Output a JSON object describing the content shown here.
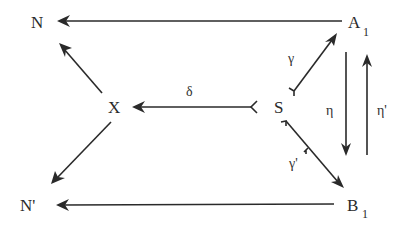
{
  "diagram": {
    "type": "commutative-diagram",
    "nodes": {
      "N": {
        "label": "N",
        "x": 38,
        "y": 28
      },
      "A1": {
        "label": "A",
        "subscript": "1",
        "x": 350,
        "y": 28
      },
      "X": {
        "label": "X",
        "x": 114,
        "y": 113
      },
      "S": {
        "label": "S",
        "x": 273,
        "y": 113
      },
      "N_prime": {
        "label": "N'",
        "x": 32,
        "y": 211
      },
      "B1": {
        "label": "B",
        "subscript": "1",
        "x": 347,
        "y": 211
      }
    },
    "edges": [
      {
        "id": "A1-to-N",
        "from": "A1",
        "to": "N",
        "label": ""
      },
      {
        "id": "X-to-N",
        "from": "X",
        "to": "N",
        "label": ""
      },
      {
        "id": "S-to-X",
        "from": "S",
        "to": "X",
        "label": "δ",
        "tail": "monic-hook"
      },
      {
        "id": "X-to-N_prime",
        "from": "X",
        "to": "N_prime",
        "label": ""
      },
      {
        "id": "S-to-A1",
        "from": "S",
        "to": "A1",
        "label": "γ",
        "tail": "monic-hook"
      },
      {
        "id": "S-to-B1",
        "from": "S",
        "to": "B1",
        "label": "γ'",
        "tail": "monic-hook"
      },
      {
        "id": "A1-to-B1",
        "from": "A1",
        "to": "B1",
        "label": "η"
      },
      {
        "id": "B1-to-A1",
        "from": "B1",
        "to": "A1",
        "label": "η'"
      },
      {
        "id": "B1-to-N_prime",
        "from": "B1",
        "to": "N_prime",
        "label": ""
      }
    ],
    "labels": {
      "delta": "δ",
      "gamma": "γ",
      "gamma_prime": "γ'",
      "eta": "η",
      "eta_prime": "η'"
    },
    "colors": {
      "ink": "#2a2a2a",
      "background": "#ffffff"
    }
  }
}
